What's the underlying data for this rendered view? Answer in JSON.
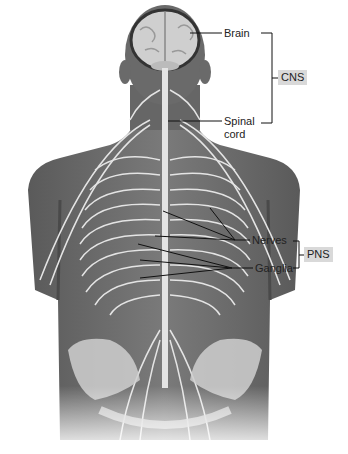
{
  "figure": {
    "labels": {
      "brain": "Brain",
      "spinal_line1": "Spinal",
      "spinal_line2": "cord",
      "nerves": "Nerves",
      "ganglia": "Ganglia"
    },
    "groups": {
      "cns": "CNS",
      "pns": "PNS"
    },
    "colors": {
      "skin": "#6e6e6e",
      "skin_dark": "#555555",
      "nerve": "#e4e4e4",
      "bone": "#d0d0d0",
      "brain": "#cfcfcf",
      "badge": "#d9d9d9",
      "leader": "#111111"
    }
  }
}
